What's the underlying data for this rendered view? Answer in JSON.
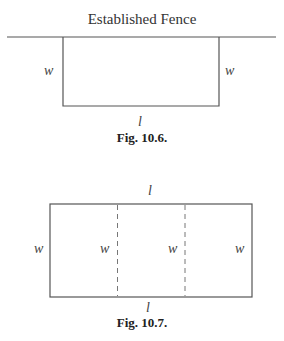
{
  "figures": [
    {
      "id": "fig-10-6",
      "title": "Established Fence",
      "caption": "Fig. 10.6.",
      "labels": {
        "left": "w",
        "right": "w",
        "bottom": "l"
      }
    },
    {
      "id": "fig-10-7",
      "caption": "Fig. 10.7.",
      "labels": {
        "top": "l",
        "bottom": "l",
        "w1": "w",
        "w2": "w",
        "w3": "w",
        "w4": "w"
      }
    }
  ],
  "colors": {
    "line": "#555555",
    "text": "#333333"
  }
}
